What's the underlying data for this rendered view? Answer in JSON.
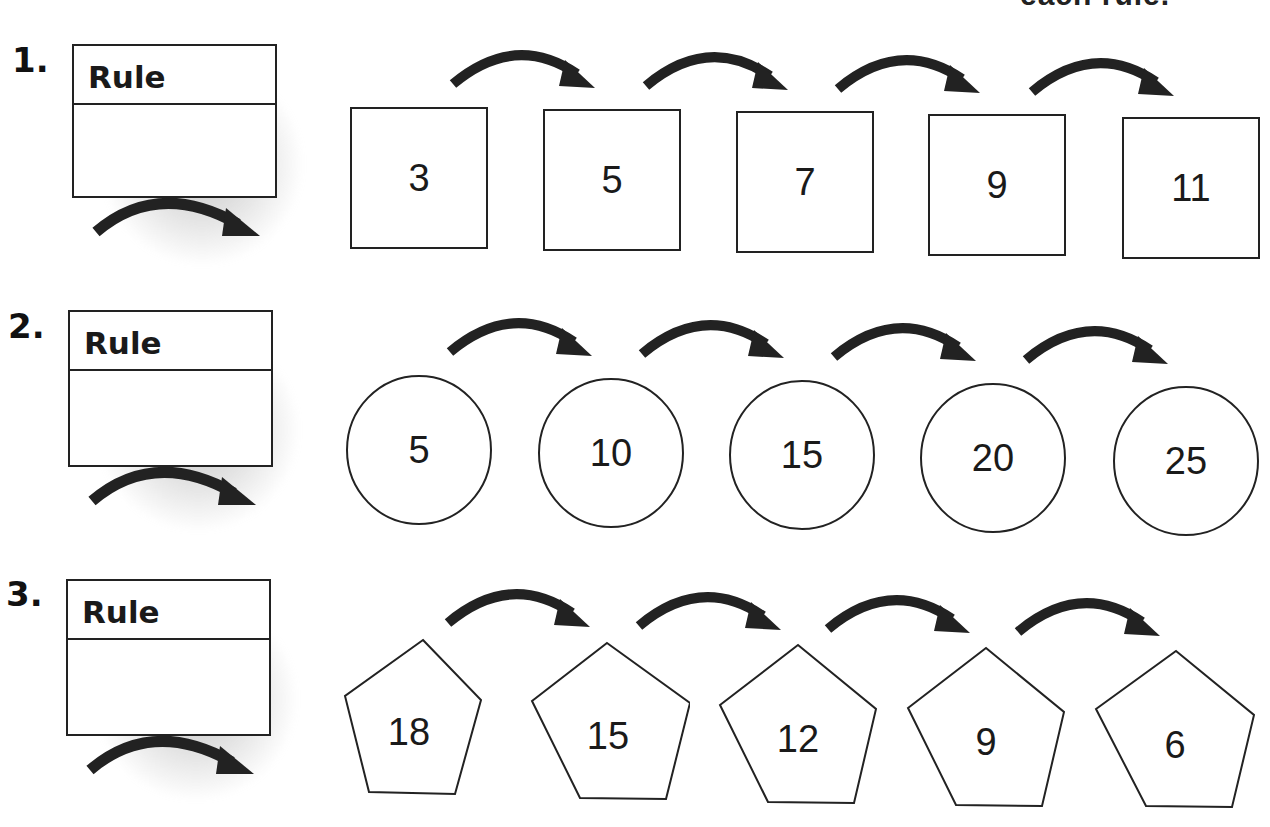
{
  "header": {
    "clipped_text": "each rule."
  },
  "rule_label": "Rule",
  "rows": [
    {
      "number": "1.",
      "shape": "square",
      "values": [
        "3",
        "5",
        "7",
        "9",
        "11"
      ],
      "rule_answer": ""
    },
    {
      "number": "2.",
      "shape": "circle",
      "values": [
        "5",
        "10",
        "15",
        "20",
        "25"
      ],
      "rule_answer": ""
    },
    {
      "number": "3.",
      "shape": "pentagon",
      "values": [
        "18",
        "15",
        "12",
        "9",
        "6"
      ],
      "rule_answer": ""
    }
  ],
  "colors": {
    "ink": "#1a1a1a",
    "shadow": "#a0a0a0",
    "paper": "#ffffff"
  }
}
